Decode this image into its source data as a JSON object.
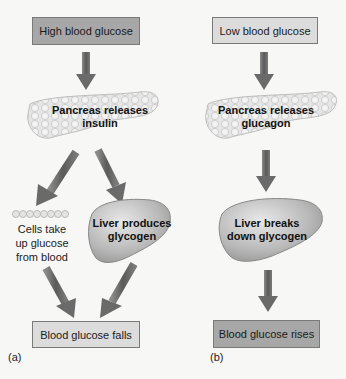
{
  "panel_a": {
    "letter": "(a)",
    "start_box": "High blood glucose",
    "pancreas_label": "Pancreas releases insulin",
    "pancreas_line1": "Pancreas releases",
    "pancreas_line2": "insulin",
    "cells_line1": "Cells take",
    "cells_line2": "up glucose",
    "cells_line3": "from blood",
    "liver_line1": "Liver produces",
    "liver_line2": "glycogen",
    "end_box": "Blood glucose falls"
  },
  "panel_b": {
    "letter": "(b)",
    "start_box": "Low blood glucose",
    "pancreas_line1": "Pancreas releases",
    "pancreas_line2": "glucagon",
    "liver_line1": "Liver breaks",
    "liver_line2": "down glycogen",
    "end_box": "Blood glucose rises"
  },
  "colors": {
    "dark_box": "#a7a7a7",
    "light_box": "#dcdcdc",
    "arrow": "#6e6e6e",
    "organ": "#c9c9c9"
  }
}
